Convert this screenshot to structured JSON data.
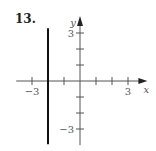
{
  "problem": {
    "number": "13."
  },
  "chart_data": {
    "type": "line",
    "title": "",
    "xlabel": "x",
    "ylabel": "y",
    "xlim": [
      -3.3,
      3.4
    ],
    "ylim": [
      -3.2,
      3.5
    ],
    "xticks": [
      -3,
      -2,
      -1,
      1,
      2,
      3
    ],
    "yticks": [
      -3,
      -2,
      -1,
      1,
      2,
      3
    ],
    "xtick_labels": [
      {
        "value": -3,
        "label": "−3"
      },
      {
        "value": 3,
        "label": "3"
      }
    ],
    "ytick_labels": [
      {
        "value": 3,
        "label": "3"
      },
      {
        "value": -3,
        "label": "−3"
      }
    ],
    "grid": false,
    "series": [
      {
        "name": "x = -2",
        "kind": "vertical-line",
        "x": -2,
        "y_range": [
          -3.2,
          3.3
        ],
        "color": "#111111"
      }
    ],
    "axis_color": "#555555"
  }
}
